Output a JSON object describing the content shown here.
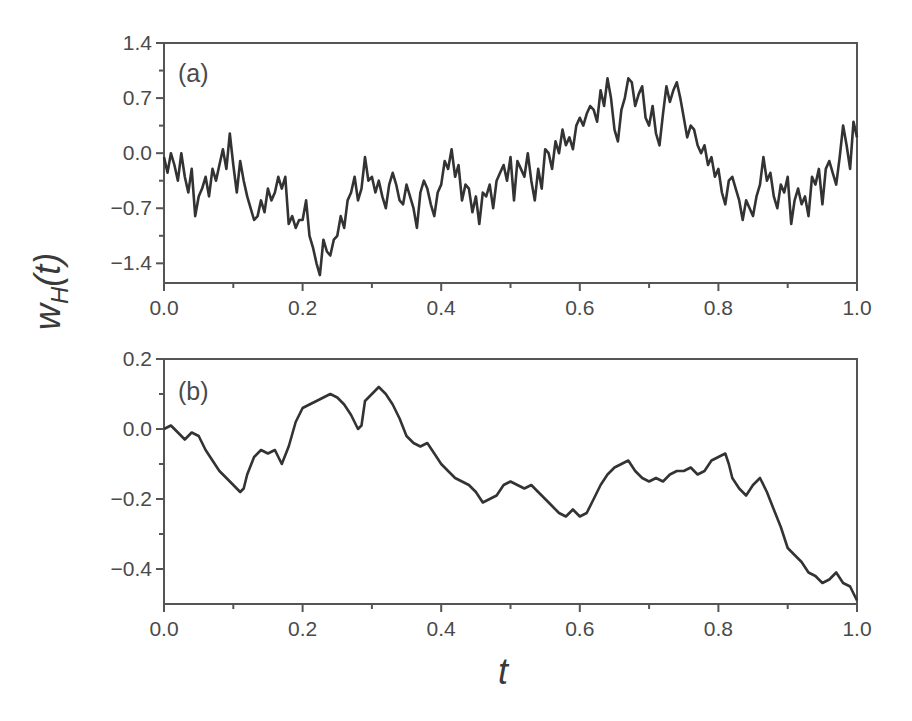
{
  "figure": {
    "ylabel_main": "w",
    "ylabel_sub": "H",
    "ylabel_arg": "(t)",
    "xlabel": "t"
  },
  "chart_data": [
    {
      "type": "line",
      "panel": "(a)",
      "title": "",
      "xlabel": "t",
      "ylabel": "w_H(t)",
      "xlim": [
        0.0,
        1.0
      ],
      "ylim": [
        -1.65,
        1.4
      ],
      "xticks": [
        "0.0",
        "0.2",
        "0.4",
        "0.6",
        "0.8",
        "1.0"
      ],
      "yticks": [
        "1.4",
        "0.7",
        "0.0",
        "-0.7",
        "-1.4"
      ],
      "grid": false,
      "legend": null,
      "series": [
        {
          "name": "w_H(t), rough path",
          "color": "#333333",
          "x": [
            0.0,
            0.005,
            0.01,
            0.015,
            0.02,
            0.025,
            0.03,
            0.035,
            0.04,
            0.045,
            0.05,
            0.055,
            0.06,
            0.065,
            0.07,
            0.075,
            0.08,
            0.085,
            0.09,
            0.095,
            0.1,
            0.105,
            0.11,
            0.115,
            0.12,
            0.125,
            0.13,
            0.135,
            0.14,
            0.145,
            0.15,
            0.155,
            0.16,
            0.165,
            0.17,
            0.175,
            0.18,
            0.185,
            0.19,
            0.195,
            0.2,
            0.205,
            0.21,
            0.215,
            0.22,
            0.225,
            0.23,
            0.235,
            0.24,
            0.245,
            0.25,
            0.255,
            0.26,
            0.265,
            0.27,
            0.275,
            0.28,
            0.285,
            0.29,
            0.295,
            0.3,
            0.305,
            0.31,
            0.315,
            0.32,
            0.325,
            0.33,
            0.335,
            0.34,
            0.345,
            0.35,
            0.355,
            0.36,
            0.365,
            0.37,
            0.375,
            0.38,
            0.385,
            0.39,
            0.395,
            0.4,
            0.405,
            0.41,
            0.415,
            0.42,
            0.425,
            0.43,
            0.435,
            0.44,
            0.445,
            0.45,
            0.455,
            0.46,
            0.465,
            0.47,
            0.475,
            0.48,
            0.485,
            0.49,
            0.495,
            0.5,
            0.505,
            0.51,
            0.515,
            0.52,
            0.525,
            0.53,
            0.535,
            0.54,
            0.545,
            0.55,
            0.555,
            0.56,
            0.565,
            0.57,
            0.575,
            0.58,
            0.585,
            0.59,
            0.595,
            0.6,
            0.605,
            0.61,
            0.615,
            0.62,
            0.625,
            0.63,
            0.635,
            0.64,
            0.645,
            0.65,
            0.655,
            0.66,
            0.665,
            0.67,
            0.675,
            0.68,
            0.685,
            0.69,
            0.695,
            0.7,
            0.705,
            0.71,
            0.715,
            0.72,
            0.725,
            0.73,
            0.735,
            0.74,
            0.745,
            0.75,
            0.755,
            0.76,
            0.765,
            0.77,
            0.775,
            0.78,
            0.785,
            0.79,
            0.795,
            0.8,
            0.805,
            0.81,
            0.815,
            0.82,
            0.825,
            0.83,
            0.835,
            0.84,
            0.845,
            0.85,
            0.855,
            0.86,
            0.865,
            0.87,
            0.875,
            0.88,
            0.885,
            0.89,
            0.895,
            0.9,
            0.905,
            0.91,
            0.915,
            0.92,
            0.925,
            0.93,
            0.935,
            0.94,
            0.945,
            0.95,
            0.955,
            0.96,
            0.965,
            0.97,
            0.975,
            0.98,
            0.985,
            0.99,
            0.995,
            1.0
          ],
          "y": [
            -0.05,
            -0.25,
            0.0,
            -0.15,
            -0.35,
            0.0,
            -0.3,
            -0.5,
            -0.2,
            -0.8,
            -0.55,
            -0.45,
            -0.3,
            -0.55,
            -0.2,
            -0.35,
            -0.15,
            0.05,
            -0.2,
            0.25,
            -0.15,
            -0.5,
            -0.1,
            -0.35,
            -0.55,
            -0.7,
            -0.85,
            -0.8,
            -0.6,
            -0.75,
            -0.45,
            -0.6,
            -0.5,
            -0.3,
            -0.45,
            -0.3,
            -0.9,
            -0.8,
            -0.95,
            -0.85,
            -0.85,
            -0.6,
            -1.05,
            -1.2,
            -1.4,
            -1.55,
            -1.1,
            -1.25,
            -1.3,
            -1.1,
            -1.05,
            -0.8,
            -0.95,
            -0.6,
            -0.5,
            -0.3,
            -0.6,
            -0.45,
            -0.05,
            -0.35,
            -0.3,
            -0.5,
            -0.35,
            -0.55,
            -0.7,
            -0.4,
            -0.25,
            -0.4,
            -0.6,
            -0.65,
            -0.4,
            -0.55,
            -0.7,
            -0.95,
            -0.5,
            -0.35,
            -0.45,
            -0.65,
            -0.8,
            -0.5,
            -0.4,
            -0.1,
            -0.2,
            0.05,
            -0.3,
            -0.15,
            -0.6,
            -0.4,
            -0.45,
            -0.75,
            -0.55,
            -0.9,
            -0.5,
            -0.55,
            -0.4,
            -0.7,
            -0.35,
            -0.25,
            -0.15,
            -0.35,
            -0.05,
            -0.6,
            -0.1,
            -0.2,
            -0.3,
            0.0,
            -0.35,
            -0.6,
            -0.2,
            -0.45,
            0.05,
            0.0,
            -0.2,
            0.15,
            0.0,
            0.3,
            0.1,
            0.2,
            0.05,
            0.35,
            0.45,
            0.35,
            0.5,
            0.6,
            0.55,
            0.4,
            0.8,
            0.6,
            0.95,
            0.7,
            0.3,
            0.15,
            0.55,
            0.7,
            0.95,
            0.9,
            0.6,
            0.75,
            0.85,
            0.45,
            0.35,
            0.6,
            0.25,
            0.1,
            0.5,
            0.85,
            0.65,
            0.8,
            0.9,
            0.7,
            0.45,
            0.2,
            0.35,
            0.3,
            0.1,
            0.0,
            0.1,
            -0.15,
            -0.05,
            -0.3,
            -0.2,
            -0.5,
            -0.65,
            -0.35,
            -0.3,
            -0.45,
            -0.6,
            -0.85,
            -0.6,
            -0.7,
            -0.8,
            -0.55,
            -0.4,
            -0.05,
            -0.35,
            -0.25,
            -0.55,
            -0.7,
            -0.4,
            -0.5,
            -0.3,
            -0.9,
            -0.6,
            -0.45,
            -0.65,
            -0.55,
            -0.8,
            -0.3,
            -0.4,
            -0.2,
            -0.65,
            -0.2,
            -0.1,
            -0.25,
            -0.4,
            -0.05,
            0.35,
            0.1,
            -0.2,
            0.4,
            0.2,
            0.15,
            0.0,
            0.3,
            0.25,
            0.2,
            0.15,
            0.05
          ]
        }
      ]
    },
    {
      "type": "line",
      "panel": "(b)",
      "title": "",
      "xlabel": "t",
      "ylabel": "w_H(t)",
      "xlim": [
        0.0,
        1.0
      ],
      "ylim": [
        -0.5,
        0.2
      ],
      "xticks": [
        "0.0",
        "0.2",
        "0.4",
        "0.6",
        "0.8",
        "1.0"
      ],
      "yticks": [
        "0.2",
        "0.0",
        "-0.2",
        "-0.4"
      ],
      "grid": false,
      "legend": null,
      "series": [
        {
          "name": "w_H(t), smooth path",
          "color": "#333333",
          "x": [
            0.0,
            0.01,
            0.02,
            0.03,
            0.04,
            0.05,
            0.06,
            0.07,
            0.08,
            0.09,
            0.1,
            0.11,
            0.115,
            0.12,
            0.13,
            0.14,
            0.15,
            0.16,
            0.17,
            0.18,
            0.19,
            0.2,
            0.21,
            0.22,
            0.23,
            0.24,
            0.25,
            0.26,
            0.27,
            0.28,
            0.285,
            0.29,
            0.3,
            0.31,
            0.32,
            0.33,
            0.34,
            0.35,
            0.36,
            0.37,
            0.38,
            0.39,
            0.4,
            0.41,
            0.42,
            0.43,
            0.44,
            0.45,
            0.46,
            0.47,
            0.48,
            0.49,
            0.5,
            0.51,
            0.52,
            0.53,
            0.54,
            0.55,
            0.56,
            0.57,
            0.58,
            0.59,
            0.6,
            0.61,
            0.62,
            0.63,
            0.64,
            0.65,
            0.66,
            0.67,
            0.68,
            0.69,
            0.7,
            0.71,
            0.72,
            0.73,
            0.74,
            0.75,
            0.76,
            0.77,
            0.78,
            0.79,
            0.8,
            0.81,
            0.815,
            0.82,
            0.83,
            0.84,
            0.85,
            0.86,
            0.87,
            0.88,
            0.89,
            0.9,
            0.91,
            0.92,
            0.93,
            0.94,
            0.95,
            0.96,
            0.97,
            0.98,
            0.99,
            1.0
          ],
          "y": [
            0.0,
            0.01,
            -0.01,
            -0.03,
            -0.01,
            -0.02,
            -0.06,
            -0.09,
            -0.12,
            -0.14,
            -0.16,
            -0.18,
            -0.17,
            -0.13,
            -0.08,
            -0.06,
            -0.07,
            -0.06,
            -0.1,
            -0.05,
            0.02,
            0.06,
            0.07,
            0.08,
            0.09,
            0.1,
            0.09,
            0.07,
            0.04,
            0.0,
            0.01,
            0.08,
            0.1,
            0.12,
            0.1,
            0.07,
            0.03,
            -0.02,
            -0.04,
            -0.05,
            -0.04,
            -0.07,
            -0.1,
            -0.12,
            -0.14,
            -0.15,
            -0.16,
            -0.18,
            -0.21,
            -0.2,
            -0.19,
            -0.16,
            -0.15,
            -0.16,
            -0.17,
            -0.16,
            -0.18,
            -0.2,
            -0.22,
            -0.24,
            -0.25,
            -0.23,
            -0.25,
            -0.24,
            -0.2,
            -0.16,
            -0.13,
            -0.11,
            -0.1,
            -0.09,
            -0.12,
            -0.14,
            -0.15,
            -0.14,
            -0.15,
            -0.13,
            -0.12,
            -0.12,
            -0.11,
            -0.13,
            -0.12,
            -0.09,
            -0.08,
            -0.07,
            -0.1,
            -0.14,
            -0.17,
            -0.19,
            -0.16,
            -0.14,
            -0.18,
            -0.23,
            -0.28,
            -0.34,
            -0.36,
            -0.38,
            -0.41,
            -0.42,
            -0.44,
            -0.43,
            -0.41,
            -0.44,
            -0.45,
            -0.49
          ]
        }
      ]
    }
  ]
}
